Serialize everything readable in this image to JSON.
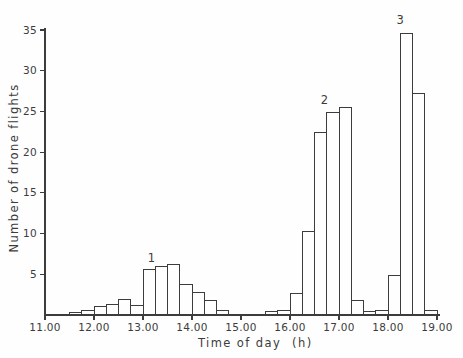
{
  "figure": {
    "background": "#fefefe",
    "ink_color": "#3c3c3c",
    "bar_fill": "#fefefe"
  },
  "chart_data": {
    "type": "bar",
    "subtype": "histogram",
    "title": "",
    "xlabel": "Time of day",
    "xlabel_unit": "(h)",
    "ylabel": "Number of drone flights",
    "xlim": [
      11.0,
      19.0
    ],
    "ylim": [
      0,
      35
    ],
    "grid": false,
    "legend": "none",
    "bar_fill": "#fefefe",
    "bar_stroke": "#3c3c3c",
    "bin_width_hours": 0.25,
    "x_ticks": [
      {
        "value": 11,
        "label": "11.00"
      },
      {
        "value": 12,
        "label": "12.00"
      },
      {
        "value": 13,
        "label": "13.00"
      },
      {
        "value": 14,
        "label": "14.00"
      },
      {
        "value": 15,
        "label": "15.00"
      },
      {
        "value": 16,
        "label": "16.00"
      },
      {
        "value": 17,
        "label": "17.00"
      },
      {
        "value": 18,
        "label": "18.00"
      },
      {
        "value": 19,
        "label": "19.00"
      }
    ],
    "y_ticks": [
      {
        "value": 5,
        "label": "5"
      },
      {
        "value": 10,
        "label": "10"
      },
      {
        "value": 15,
        "label": "15"
      },
      {
        "value": 20,
        "label": "20"
      },
      {
        "value": 25,
        "label": "25"
      },
      {
        "value": 30,
        "label": "30"
      },
      {
        "value": 35,
        "label": "35"
      }
    ],
    "bins": [
      {
        "x": 11.5,
        "y": 0.3
      },
      {
        "x": 11.75,
        "y": 0.5
      },
      {
        "x": 12.0,
        "y": 1.0
      },
      {
        "x": 12.25,
        "y": 1.3
      },
      {
        "x": 12.5,
        "y": 1.9
      },
      {
        "x": 12.75,
        "y": 1.2
      },
      {
        "x": 13.0,
        "y": 5.6
      },
      {
        "x": 13.25,
        "y": 6.0
      },
      {
        "x": 13.5,
        "y": 6.2
      },
      {
        "x": 13.75,
        "y": 3.7
      },
      {
        "x": 14.0,
        "y": 2.8
      },
      {
        "x": 14.25,
        "y": 1.8
      },
      {
        "x": 14.5,
        "y": 0.5
      },
      {
        "x": 15.5,
        "y": 0.4
      },
      {
        "x": 15.75,
        "y": 0.6
      },
      {
        "x": 16.0,
        "y": 2.7
      },
      {
        "x": 16.25,
        "y": 10.3
      },
      {
        "x": 16.5,
        "y": 22.4
      },
      {
        "x": 16.75,
        "y": 24.9
      },
      {
        "x": 17.0,
        "y": 25.5
      },
      {
        "x": 17.25,
        "y": 1.8
      },
      {
        "x": 17.5,
        "y": 0.4
      },
      {
        "x": 17.75,
        "y": 0.6
      },
      {
        "x": 18.0,
        "y": 4.8
      },
      {
        "x": 18.25,
        "y": 34.6
      },
      {
        "x": 18.5,
        "y": 27.2
      },
      {
        "x": 18.75,
        "y": 0.6
      }
    ],
    "annotations": [
      {
        "label": "1",
        "x_hours": 13.17,
        "y_value": 7.0
      },
      {
        "label": "2",
        "x_hours": 16.7,
        "y_value": 26.3
      },
      {
        "label": "3",
        "x_hours": 18.25,
        "y_value": 36.2
      }
    ]
  }
}
